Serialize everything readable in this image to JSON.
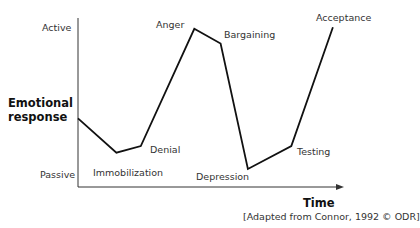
{
  "chart_data": {
    "type": "line",
    "title": "",
    "xlabel": "Time",
    "ylabel": "Emotional response",
    "y_axis_extremes": {
      "top": "Active",
      "bottom": "Passive"
    },
    "caption": "[Adapted from Connor, 1992 © ODR]",
    "grid": false,
    "ylim": [
      0,
      100
    ],
    "series": [
      {
        "name": "Change curve",
        "points": [
          {
            "stage": "",
            "x": 0,
            "y": 39
          },
          {
            "stage": "Immobilization",
            "x": 14.5,
            "y": 18
          },
          {
            "stage": "Denial",
            "x": 23.7,
            "y": 22
          },
          {
            "stage": "Anger",
            "x": 43.9,
            "y": 94
          },
          {
            "stage": "Bargaining",
            "x": 53.8,
            "y": 85
          },
          {
            "stage": "Depression",
            "x": 64.1,
            "y": 8
          },
          {
            "stage": "Testing",
            "x": 80.5,
            "y": 22
          },
          {
            "stage": "Acceptance",
            "x": 96.2,
            "y": 95
          }
        ]
      }
    ]
  },
  "labels": {
    "active": "Active",
    "passive": "Passive",
    "ylabel_line1": "Emotional",
    "ylabel_line2": "response",
    "xlabel": "Time",
    "immobilization": "Immobilization",
    "denial": "Denial",
    "anger": "Anger",
    "bargaining": "Bargaining",
    "depression": "Depression",
    "testing": "Testing",
    "acceptance": "Acceptance",
    "caption": "[Adapted from Connor, 1992 © ODR]"
  }
}
